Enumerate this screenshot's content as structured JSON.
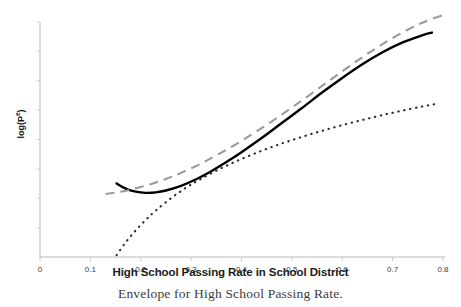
{
  "chart_data": {
    "type": "line",
    "title": "",
    "caption": "Envelope for High School Passing Rate.",
    "xlabel": "High School Passing Rate in School District",
    "ylabel": "log(Pᵉ)",
    "ylabel_base": "log(P",
    "ylabel_sup": "e",
    "ylabel_close": ")",
    "xlim": [
      0,
      0.8
    ],
    "ylim": [
      0,
      1
    ],
    "grid": false,
    "legend": "none",
    "xticks": [
      0,
      0.1,
      0.2,
      0.3,
      0.4,
      0.5,
      0.6,
      0.7,
      0.8
    ],
    "xticklabels": [
      "0",
      "0.1",
      "0.2",
      "0.3",
      "0.4",
      "0.5",
      "0.6",
      "0.7",
      "0.8"
    ],
    "yticks": [],
    "yticklabels": [],
    "series": [
      {
        "name": "fitted-curve",
        "style": "solid",
        "color": "#000000",
        "x": [
          0.152,
          0.17,
          0.19,
          0.21,
          0.23,
          0.25,
          0.28,
          0.31,
          0.34,
          0.37,
          0.4,
          0.44,
          0.48,
          0.52,
          0.56,
          0.6,
          0.64,
          0.68,
          0.72,
          0.76,
          0.778
        ],
        "y": [
          0.313,
          0.291,
          0.278,
          0.273,
          0.275,
          0.283,
          0.303,
          0.331,
          0.365,
          0.404,
          0.446,
          0.506,
          0.57,
          0.634,
          0.7,
          0.762,
          0.82,
          0.871,
          0.913,
          0.944,
          0.955
        ]
      },
      {
        "name": "upper-envelope",
        "style": "dashed",
        "color": "#9a9a9a",
        "x": [
          0.13,
          0.16,
          0.19,
          0.22,
          0.25,
          0.28,
          0.32,
          0.36,
          0.4,
          0.44,
          0.48,
          0.52,
          0.56,
          0.6,
          0.64,
          0.68,
          0.72,
          0.76,
          0.8
        ],
        "y": [
          0.268,
          0.278,
          0.292,
          0.31,
          0.332,
          0.358,
          0.398,
          0.444,
          0.494,
          0.548,
          0.606,
          0.666,
          0.728,
          0.79,
          0.85,
          0.906,
          0.956,
          0.998,
          1.03
        ]
      },
      {
        "name": "lower-envelope",
        "style": "dotted",
        "color": "#2b2b2b",
        "x": [
          0.152,
          0.17,
          0.19,
          0.21,
          0.23,
          0.26,
          0.29,
          0.32,
          0.36,
          0.4,
          0.44,
          0.48,
          0.52,
          0.56,
          0.6,
          0.64,
          0.68,
          0.72,
          0.76,
          0.79
        ],
        "y": [
          0.008,
          0.062,
          0.113,
          0.158,
          0.198,
          0.25,
          0.295,
          0.333,
          0.378,
          0.417,
          0.452,
          0.483,
          0.511,
          0.537,
          0.561,
          0.583,
          0.604,
          0.623,
          0.641,
          0.653
        ]
      }
    ]
  },
  "axes": {
    "x_axis_name": "x-axis",
    "y_axis_name": "y-axis"
  }
}
